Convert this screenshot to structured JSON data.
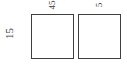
{
  "diagram": {
    "type": "two-square-dimensioned-figure",
    "background_color": "#ffffff",
    "outline_color": "#3f3f3f",
    "fill_color": "#ffffff",
    "labels": {
      "left_dimension": "15",
      "top_dimension_first": "45",
      "top_dimension_second": "5"
    },
    "shapes": [
      {
        "name": "square-1",
        "label_top": "45",
        "label_left": "15"
      },
      {
        "name": "square-2",
        "label_top": "5"
      }
    ]
  }
}
